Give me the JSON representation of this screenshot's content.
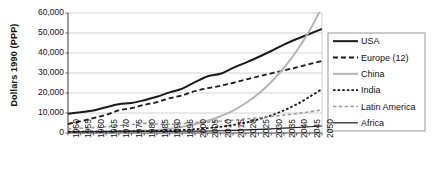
{
  "chart_data": {
    "type": "line",
    "title": "",
    "xlabel": "",
    "ylabel": "Dollars 1990 (PPP)",
    "xlim": [
      1950,
      2050
    ],
    "ylim": [
      0,
      60000
    ],
    "grid": true,
    "legend_position": "right",
    "x": [
      1950,
      1955,
      1960,
      1965,
      1970,
      1975,
      1980,
      1985,
      1990,
      1995,
      2000,
      2005,
      2010,
      2015,
      2020,
      2025,
      2030,
      2035,
      2040,
      2045,
      2050
    ],
    "ytick_labels": [
      "0",
      "10,000",
      "20,000",
      "30,000",
      "40,000",
      "50,000",
      "60,000"
    ],
    "ytick_values": [
      0,
      10000,
      20000,
      30000,
      40000,
      50000,
      60000
    ],
    "xtick_labels": [
      "1950",
      "1955",
      "1960",
      "1965",
      "1970",
      "1975",
      "1980",
      "1985",
      "1990",
      "1995",
      "2000",
      "2005",
      "2010",
      "2015",
      "2020",
      "2025",
      "2030",
      "2035",
      "2040",
      "2045",
      "2050"
    ],
    "series": [
      {
        "name": "USA",
        "color": "#1a1a1a",
        "style": "solid",
        "width": 2.0,
        "values": [
          9600,
          10400,
          11200,
          12900,
          14400,
          15000,
          16400,
          18100,
          20300,
          22200,
          25400,
          28400,
          29600,
          32600,
          35200,
          38000,
          41000,
          44200,
          47000,
          49500,
          52000
        ]
      },
      {
        "name": "Europe (12)",
        "color": "#1a1a1a",
        "style": "long-dash",
        "width": 1.8,
        "values": [
          4500,
          5900,
          7400,
          9100,
          11300,
          12400,
          14100,
          15400,
          17400,
          18800,
          21000,
          22400,
          23600,
          25100,
          26700,
          28300,
          29800,
          31300,
          32800,
          34400,
          36000
        ]
      },
      {
        "name": "China",
        "color": "#b4b4b4",
        "style": "solid",
        "width": 2.0,
        "values": [
          450,
          560,
          600,
          700,
          820,
          950,
          1100,
          1500,
          2100,
          3100,
          4400,
          6100,
          8400,
          11200,
          15000,
          19600,
          25500,
          32500,
          41000,
          51000,
          63000
        ]
      },
      {
        "name": "India",
        "color": "#1a1a1a",
        "style": "short-dash",
        "width": 1.8,
        "values": [
          620,
          650,
          700,
          730,
          800,
          850,
          920,
          1050,
          1250,
          1500,
          1900,
          2400,
          3100,
          4000,
          5200,
          6800,
          8800,
          11300,
          14300,
          18000,
          22000
        ]
      },
      {
        "name": "Latin America",
        "color": "#9a9a9a",
        "style": "dash",
        "width": 1.6,
        "values": [
          2100,
          2400,
          2700,
          3100,
          3700,
          4200,
          4800,
          4500,
          4400,
          4700,
          5200,
          5500,
          5900,
          6400,
          7000,
          7600,
          8300,
          9000,
          9700,
          10600,
          11500
        ]
      },
      {
        "name": "Africa",
        "color": "#1a1a1a",
        "style": "solid",
        "width": 1.2,
        "values": [
          550,
          600,
          650,
          700,
          780,
          830,
          870,
          860,
          850,
          870,
          920,
          1000,
          1120,
          1300,
          1520,
          1780,
          2080,
          2400,
          2750,
          3120,
          3500
        ]
      }
    ]
  },
  "legend": {
    "items": [
      {
        "label": "USA"
      },
      {
        "label": "Europe (12)"
      },
      {
        "label": "China"
      },
      {
        "label": "India"
      },
      {
        "label": "Latin America"
      },
      {
        "label": "Africa"
      }
    ]
  }
}
